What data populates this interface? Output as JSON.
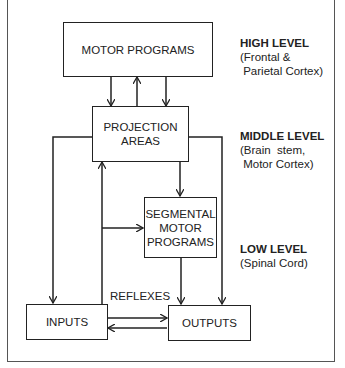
{
  "boxes": {
    "motor_programs": "MOTOR PROGRAMS",
    "projection_areas_line1": "PROJECTION",
    "projection_areas_line2": "AREAS",
    "segmental_line1": "SEGMENTAL",
    "segmental_line2": "MOTOR",
    "segmental_line3": "PROGRAMS",
    "inputs": "INPUTS",
    "outputs": "OUTPUTS"
  },
  "edge_labels": {
    "reflexes": "REFLEXES"
  },
  "levels": [
    {
      "title": "HIGH LEVEL",
      "line1": "(Frontal &",
      "line2": " Parietal Cortex)"
    },
    {
      "title": "MIDDLE LEVEL",
      "line1": "(Brain  stem,",
      "line2": " Motor Cortex)"
    },
    {
      "title": "LOW LEVEL",
      "line1": "(Spinal Cord)",
      "line2": ""
    }
  ]
}
